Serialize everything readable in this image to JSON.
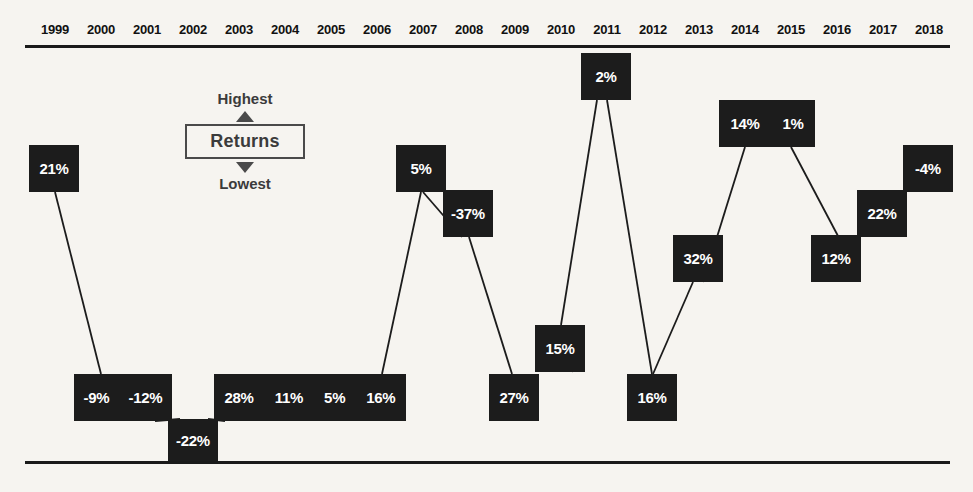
{
  "chart_data": {
    "type": "table",
    "title": "",
    "subtitle": "",
    "xlabel": "",
    "ylabel": "Returns",
    "grid": false,
    "legend_position": "inside-left",
    "categories": [
      "1999",
      "2000",
      "2001",
      "2002",
      "2003",
      "2004",
      "2005",
      "2006",
      "2007",
      "2008",
      "2009",
      "2010",
      "2011",
      "2012",
      "2013",
      "2014",
      "2015",
      "2016",
      "2017",
      "2018"
    ],
    "values": [
      21,
      -9,
      -12,
      -22,
      28,
      11,
      5,
      16,
      5,
      -37,
      27,
      15,
      2,
      16,
      32,
      14,
      1,
      12,
      22,
      -4
    ],
    "value_labels": [
      "21%",
      "-9%",
      "-12%",
      "-22%",
      "28%",
      "11%",
      "5%",
      "16%",
      "5%",
      "-37%",
      "27%",
      "15%",
      "2%",
      "16%",
      "32%",
      "14%",
      "1%",
      "12%",
      "22%",
      "-4%"
    ],
    "annotations": [
      "Highest",
      "Returns",
      "Lowest"
    ]
  },
  "axis": {
    "years": [
      {
        "label": "1999",
        "x": 55
      },
      {
        "label": "2000",
        "x": 101
      },
      {
        "label": "2001",
        "x": 147
      },
      {
        "label": "2002",
        "x": 193
      },
      {
        "label": "2003",
        "x": 239
      },
      {
        "label": "2004",
        "x": 285
      },
      {
        "label": "2005",
        "x": 331
      },
      {
        "label": "2006",
        "x": 377
      },
      {
        "label": "2007",
        "x": 423
      },
      {
        "label": "2008",
        "x": 469
      },
      {
        "label": "2009",
        "x": 515
      },
      {
        "label": "2010",
        "x": 561
      },
      {
        "label": "2011",
        "x": 607
      },
      {
        "label": "2012",
        "x": 653
      },
      {
        "label": "2013",
        "x": 699
      },
      {
        "label": "2014",
        "x": 745
      },
      {
        "label": "2015",
        "x": 791
      },
      {
        "label": "2016",
        "x": 837
      },
      {
        "label": "2017",
        "x": 883
      },
      {
        "label": "2018",
        "x": 929
      }
    ]
  },
  "legend": {
    "highest": "Highest",
    "title": "Returns",
    "lowest": "Lowest"
  },
  "cells": [
    {
      "id": "cell-1999",
      "years": [
        "1999"
      ],
      "labels": [
        "21%"
      ],
      "x": 29,
      "y": 145,
      "w": 50,
      "h": 47
    },
    {
      "id": "cell-2000-2001",
      "years": [
        "2000",
        "2001"
      ],
      "labels": [
        "-9%",
        "-12%"
      ],
      "x": 74,
      "y": 374,
      "w": 98,
      "h": 47
    },
    {
      "id": "cell-2002",
      "years": [
        "2002"
      ],
      "labels": [
        "-22%"
      ],
      "x": 168,
      "y": 419,
      "w": 50,
      "h": 43
    },
    {
      "id": "cell-2003-2006",
      "years": [
        "2003",
        "2004",
        "2005",
        "2006"
      ],
      "labels": [
        "28%",
        "11%",
        "5%",
        "16%"
      ],
      "x": 214,
      "y": 374,
      "w": 192,
      "h": 47
    },
    {
      "id": "cell-2007",
      "years": [
        "2007"
      ],
      "labels": [
        "5%"
      ],
      "x": 396,
      "y": 145,
      "w": 50,
      "h": 47
    },
    {
      "id": "cell-2008",
      "years": [
        "2008"
      ],
      "labels": [
        "-37%"
      ],
      "x": 443,
      "y": 190,
      "w": 50,
      "h": 47
    },
    {
      "id": "cell-2009",
      "years": [
        "2009"
      ],
      "labels": [
        "27%"
      ],
      "x": 489,
      "y": 374,
      "w": 50,
      "h": 47
    },
    {
      "id": "cell-2010",
      "years": [
        "2010"
      ],
      "labels": [
        "15%"
      ],
      "x": 535,
      "y": 325,
      "w": 50,
      "h": 47
    },
    {
      "id": "cell-2011",
      "years": [
        "2011"
      ],
      "labels": [
        "2%"
      ],
      "x": 581,
      "y": 53,
      "w": 50,
      "h": 47
    },
    {
      "id": "cell-2012",
      "years": [
        "2012"
      ],
      "labels": [
        "16%"
      ],
      "x": 627,
      "y": 374,
      "w": 50,
      "h": 47
    },
    {
      "id": "cell-2013",
      "years": [
        "2013"
      ],
      "labels": [
        "32%"
      ],
      "x": 673,
      "y": 235,
      "w": 50,
      "h": 47
    },
    {
      "id": "cell-2014-2015",
      "years": [
        "2014",
        "2015"
      ],
      "labels": [
        "14%",
        "1%"
      ],
      "x": 719,
      "y": 100,
      "w": 96,
      "h": 47
    },
    {
      "id": "cell-2016",
      "years": [
        "2016"
      ],
      "labels": [
        "12%"
      ],
      "x": 811,
      "y": 235,
      "w": 50,
      "h": 47
    },
    {
      "id": "cell-2017",
      "years": [
        "2017"
      ],
      "labels": [
        "22%"
      ],
      "x": 857,
      "y": 190,
      "w": 50,
      "h": 47
    },
    {
      "id": "cell-2018",
      "years": [
        "2018"
      ],
      "labels": [
        "-4%"
      ],
      "x": 903,
      "y": 145,
      "w": 50,
      "h": 47
    }
  ],
  "connectors": [
    {
      "id": "conn-1999-2000",
      "x1": 55,
      "y1": 192,
      "x2": 101,
      "y2": 374
    },
    {
      "id": "conn-2001-2002",
      "x1": 155,
      "y1": 421,
      "x2": 180,
      "y2": 419
    },
    {
      "id": "conn-2002-2003",
      "x1": 208,
      "y1": 419,
      "x2": 225,
      "y2": 421
    },
    {
      "id": "conn-2006-2007",
      "x1": 382,
      "y1": 374,
      "x2": 421,
      "y2": 192
    },
    {
      "id": "conn-2007-2008",
      "x1": 423,
      "y1": 192,
      "x2": 462,
      "y2": 237
    },
    {
      "id": "conn-2008-2009",
      "x1": 469,
      "y1": 237,
      "x2": 512,
      "y2": 374
    },
    {
      "id": "conn-2009-2010",
      "x1": 561,
      "y1": 325,
      "x2": 573,
      "y2": 372
    },
    {
      "id": "conn-2010-2011",
      "x1": 597,
      "y1": 100,
      "x2": 561,
      "y2": 325
    },
    {
      "id": "conn-2011-2012",
      "x1": 607,
      "y1": 100,
      "x2": 652,
      "y2": 374
    },
    {
      "id": "conn-2012-2013",
      "x1": 653,
      "y1": 374,
      "x2": 693,
      "y2": 282
    },
    {
      "id": "conn-2013-2014",
      "x1": 703,
      "y1": 282,
      "x2": 745,
      "y2": 147
    },
    {
      "id": "conn-2015-2016",
      "x1": 791,
      "y1": 147,
      "x2": 838,
      "y2": 236
    }
  ]
}
